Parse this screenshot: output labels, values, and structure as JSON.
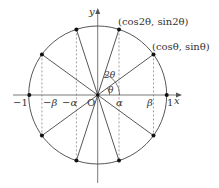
{
  "diagram": {
    "type": "unit-circle",
    "center_px": [
      97.7,
      95
    ],
    "radius_px": 69,
    "theta_deg": 36,
    "colors": {
      "stroke": "#444444",
      "axis": "#555555",
      "dot": "#111111",
      "dashed": "#777777"
    },
    "axis_labels": {
      "x": "x",
      "y": "y",
      "origin": "O"
    },
    "tick_labels": {
      "neg_one": "−1",
      "one": "1",
      "neg_beta": "−β",
      "neg_alpha": "−α",
      "alpha": "α",
      "beta": "β"
    },
    "angle_labels": {
      "theta": "θ",
      "two_theta": "2θ"
    },
    "point_labels": {
      "p_theta": "(cosθ, sinθ)",
      "p_two_theta": "(cos2θ, sin2θ)"
    },
    "points_deg": [
      36,
      72,
      108,
      144,
      216,
      252,
      288,
      324,
      0,
      180
    ]
  }
}
